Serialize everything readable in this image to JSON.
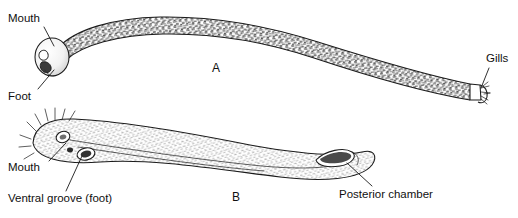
{
  "figure": {
    "background_color": "#ffffff",
    "ink_color": "#1a1a1a",
    "panels": [
      {
        "id": "A",
        "letter": "A",
        "letter_x": 216,
        "letter_y": 69,
        "description": "whole-animal lateral view, densely stippled vermiform body curving from upper left to lower right",
        "body_fill": "#ffffff",
        "texture": "dense-stipple",
        "labels": [
          {
            "key": "mouth",
            "text": "Mouth",
            "text_x": 8,
            "text_y": 19,
            "anchor": "start",
            "leader": "M 44 27 L 54 46"
          },
          {
            "key": "foot",
            "text": "Foot",
            "text_x": 8,
            "text_y": 97,
            "anchor": "start",
            "leader": "M 38 89 L 54 70"
          },
          {
            "key": "gills",
            "text": "Gills",
            "text_x": 486,
            "text_y": 59,
            "anchor": "start",
            "leader": "M 489 68 L 481 88"
          }
        ]
      },
      {
        "id": "B",
        "letter": "B",
        "letter_x": 236,
        "letter_y": 198,
        "description": "enlarged lateral view of the same animal, pale fine hatching, anterior bristles, mouth and ventral groove openings, posterior chamber aperture",
        "body_fill": "#fdfdfd",
        "texture": "fine-hatch",
        "labels": [
          {
            "key": "mouth",
            "text": "Mouth",
            "text_x": 8,
            "text_y": 168,
            "anchor": "start",
            "leader": "M 49 161 L 66 143"
          },
          {
            "key": "ventral-groove",
            "text": "Ventral groove (foot)",
            "text_x": 8,
            "text_y": 199,
            "anchor": "start",
            "leader": "M 66 191 L 82 156"
          },
          {
            "key": "posterior-chamber",
            "text": "Posterior chamber",
            "text_x": 339,
            "text_y": 195,
            "anchor": "start",
            "leader": "M 372 186 L 347 163"
          }
        ]
      }
    ]
  }
}
